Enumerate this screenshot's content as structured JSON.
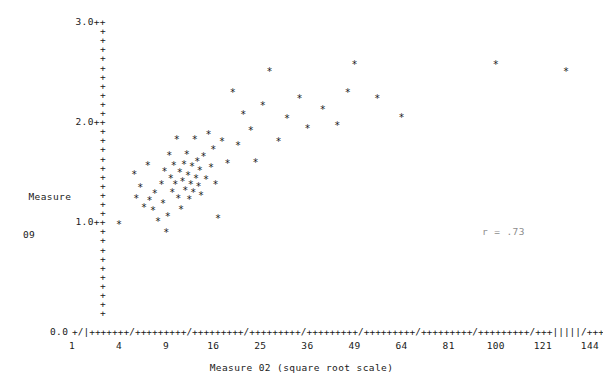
{
  "chart_data": {
    "type": "scatter",
    "title": "",
    "xlabel": "Measure 02 (square root scale)",
    "ylabel_line1": "Measure",
    "ylabel_line2": "09",
    "x_scale": "square root",
    "x_tick_labels": [
      "1",
      "4",
      "9",
      "16",
      "25",
      "36",
      "49",
      "64",
      "81",
      "100",
      "121",
      "144"
    ],
    "x_tick_values": [
      1,
      4,
      9,
      16,
      25,
      36,
      49,
      64,
      81,
      100,
      121,
      144
    ],
    "xlim": [
      1,
      144
    ],
    "y_tick_labels": [
      "3.0++",
      "+",
      "+",
      "+",
      "+",
      "+",
      "+",
      "+",
      "+",
      "+",
      "+",
      "2.0++",
      "+",
      "+",
      "+",
      "+",
      "+",
      "+",
      "+",
      "+",
      "+",
      "+",
      "1.0++",
      "+",
      "+",
      "+",
      "+",
      "+",
      "+",
      "+",
      "+",
      "+",
      "+",
      "0.0"
    ],
    "y_major_labels": [
      "3.0++",
      "2.0++",
      "1.0++",
      "0.0"
    ],
    "ylim": [
      0.0,
      3.0
    ],
    "grid": false,
    "legend": null,
    "annotation": "r = .73",
    "marker": "*",
    "axis_style": "ascii-character",
    "x_axis_characters": "+/|+++++++/+++++++++/+++++++++/+++++++++/+++++++++/+++++++++/+++++++++/+++++++++/+++|||||/+++++++++/+++++++++/",
    "points": [
      {
        "x": 4.0,
        "y": 1.04
      },
      {
        "x": 5.4,
        "y": 1.53
      },
      {
        "x": 5.6,
        "y": 1.3
      },
      {
        "x": 6.0,
        "y": 1.41
      },
      {
        "x": 6.4,
        "y": 1.21
      },
      {
        "x": 6.8,
        "y": 1.62
      },
      {
        "x": 7.0,
        "y": 1.28
      },
      {
        "x": 7.4,
        "y": 1.18
      },
      {
        "x": 7.6,
        "y": 1.35
      },
      {
        "x": 8.0,
        "y": 1.07
      },
      {
        "x": 8.4,
        "y": 1.44
      },
      {
        "x": 8.6,
        "y": 1.25
      },
      {
        "x": 8.8,
        "y": 1.56
      },
      {
        "x": 9.0,
        "y": 0.96
      },
      {
        "x": 9.2,
        "y": 1.12
      },
      {
        "x": 9.4,
        "y": 1.72
      },
      {
        "x": 9.6,
        "y": 1.5
      },
      {
        "x": 9.8,
        "y": 1.36
      },
      {
        "x": 10.0,
        "y": 1.62
      },
      {
        "x": 10.2,
        "y": 1.44
      },
      {
        "x": 10.4,
        "y": 1.88
      },
      {
        "x": 10.6,
        "y": 1.3
      },
      {
        "x": 10.8,
        "y": 1.55
      },
      {
        "x": 11.0,
        "y": 1.19
      },
      {
        "x": 11.2,
        "y": 1.47
      },
      {
        "x": 11.4,
        "y": 1.63
      },
      {
        "x": 11.6,
        "y": 1.38
      },
      {
        "x": 11.8,
        "y": 1.73
      },
      {
        "x": 12.0,
        "y": 1.52
      },
      {
        "x": 12.2,
        "y": 1.29
      },
      {
        "x": 12.4,
        "y": 1.44
      },
      {
        "x": 12.6,
        "y": 1.61
      },
      {
        "x": 12.8,
        "y": 1.36
      },
      {
        "x": 13.0,
        "y": 1.88
      },
      {
        "x": 13.2,
        "y": 1.5
      },
      {
        "x": 13.4,
        "y": 1.66
      },
      {
        "x": 13.6,
        "y": 1.42
      },
      {
        "x": 13.8,
        "y": 1.57
      },
      {
        "x": 14.0,
        "y": 1.33
      },
      {
        "x": 14.4,
        "y": 1.71
      },
      {
        "x": 14.8,
        "y": 1.49
      },
      {
        "x": 15.2,
        "y": 1.93
      },
      {
        "x": 15.6,
        "y": 1.6
      },
      {
        "x": 16.0,
        "y": 1.78
      },
      {
        "x": 16.4,
        "y": 1.44
      },
      {
        "x": 16.8,
        "y": 1.1
      },
      {
        "x": 17.5,
        "y": 1.86
      },
      {
        "x": 18.5,
        "y": 1.64
      },
      {
        "x": 19.5,
        "y": 2.34
      },
      {
        "x": 20.5,
        "y": 1.82
      },
      {
        "x": 21.5,
        "y": 2.12
      },
      {
        "x": 23.0,
        "y": 1.97
      },
      {
        "x": 24.0,
        "y": 1.65
      },
      {
        "x": 25.5,
        "y": 2.21
      },
      {
        "x": 27.0,
        "y": 2.55
      },
      {
        "x": 29.0,
        "y": 1.86
      },
      {
        "x": 31.0,
        "y": 2.09
      },
      {
        "x": 34.0,
        "y": 2.28
      },
      {
        "x": 36.0,
        "y": 1.99
      },
      {
        "x": 40.0,
        "y": 2.17
      },
      {
        "x": 44.0,
        "y": 2.02
      },
      {
        "x": 47.0,
        "y": 2.34
      },
      {
        "x": 49.0,
        "y": 2.62
      },
      {
        "x": 56.0,
        "y": 2.28
      },
      {
        "x": 64.0,
        "y": 2.1
      },
      {
        "x": 100.0,
        "y": 2.62
      },
      {
        "x": 132.0,
        "y": 2.55
      }
    ]
  },
  "geometry": {
    "plot_left_px": 72,
    "plot_right_px": 590,
    "plot_bottom_px": 331,
    "y_value_top": 3.0,
    "y_top_px": 26,
    "y_bottom_px": 331
  }
}
